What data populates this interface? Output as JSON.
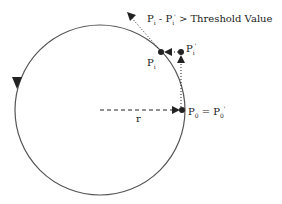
{
  "diagram": {
    "circle": {
      "cx": 100,
      "cy": 110,
      "r": 85,
      "stroke": "#555555"
    },
    "direction_arrow": "counterclockwise",
    "labels": {
      "condition": {
        "p": "P",
        "i1": "i",
        "minus": " - P",
        "i2": "i",
        "prime": "'",
        "rest": " > Threshold Value"
      },
      "pi": {
        "p": "P",
        "sub": "i"
      },
      "pi_prime": {
        "p": "P",
        "sub": "i",
        "prime": "'"
      },
      "r": "r",
      "p0": {
        "left": "P",
        "sub": "0",
        "eq": " = P",
        "sub2": "0",
        "prime": "'"
      }
    },
    "colors": {
      "ink": "#222222",
      "curve": "#555555"
    }
  }
}
